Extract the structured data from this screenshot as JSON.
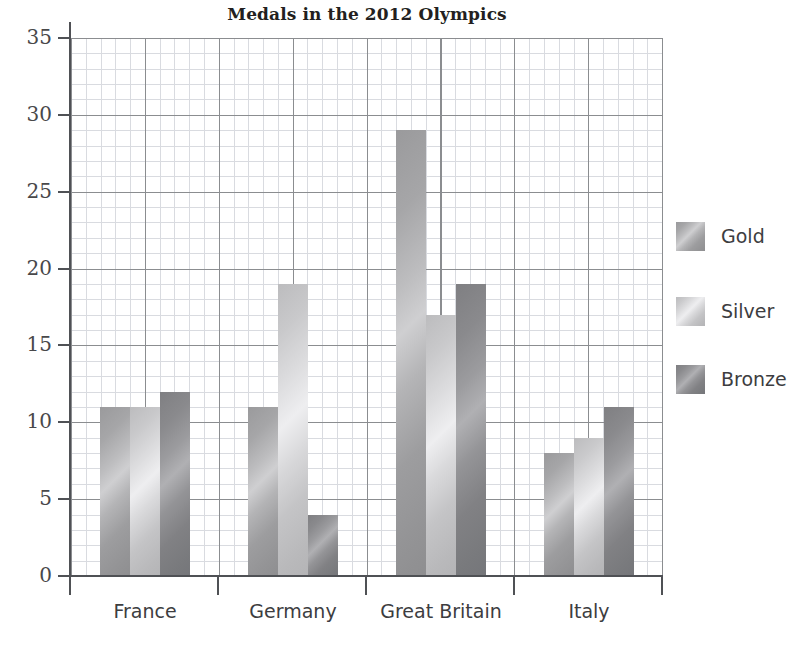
{
  "chart_data": {
    "type": "bar",
    "title": "Medals in the 2012 Olympics",
    "xlabel": "",
    "ylabel": "",
    "categories": [
      "France",
      "Germany",
      "Great Britain",
      "Italy"
    ],
    "series": [
      {
        "name": "Gold",
        "color": "#a8a8aa",
        "values": [
          11,
          11,
          29,
          8
        ]
      },
      {
        "name": "Silver",
        "color": "#d2d2d4",
        "values": [
          11,
          19,
          17,
          9
        ]
      },
      {
        "name": "Bronze",
        "color": "#8a8a8d",
        "values": [
          12,
          4,
          19,
          11
        ]
      }
    ],
    "ylim": [
      0,
      35
    ],
    "yticks": [
      0,
      5,
      10,
      15,
      20,
      25,
      30,
      35
    ],
    "ytick_labels": [
      "0",
      "5",
      "10",
      "15",
      "20",
      "25",
      "30",
      "35"
    ],
    "grid": true,
    "grid_major_step": 5,
    "grid_minor_step": 1,
    "legend_position": "right",
    "legend_entries": [
      "Gold",
      "Silver",
      "Bronze"
    ]
  }
}
